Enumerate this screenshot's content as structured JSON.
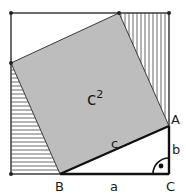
{
  "diagram": {
    "type": "pythagorean-proof-square",
    "colors": {
      "background": "#ffffff",
      "square_fill": "#bdbdbd",
      "outline": "#3a3a3a",
      "hatch": "#6a6a6a",
      "side_lines": "#111111"
    },
    "outer_square": {
      "x": 11,
      "y": 13,
      "size": 158
    },
    "inner_square": {
      "points": [
        [
          119,
          13
        ],
        [
          169,
          126
        ],
        [
          60,
          174
        ],
        [
          11,
          63
        ]
      ],
      "label": "c",
      "exponent": "2"
    },
    "vertices": {
      "A": {
        "label": "A",
        "x": 169,
        "y": 126
      },
      "B": {
        "label": "B",
        "x": 60,
        "y": 174
      },
      "C": {
        "label": "C",
        "x": 169,
        "y": 174
      }
    },
    "sides": {
      "a": {
        "label": "a"
      },
      "b": {
        "label": "b"
      },
      "c": {
        "label": "c"
      }
    },
    "corner_dots": [
      [
        11,
        13
      ],
      [
        119,
        13
      ],
      [
        169,
        13
      ],
      [
        11,
        63
      ],
      [
        11,
        174
      ]
    ],
    "right_angle_marker": {
      "x": 169,
      "y": 174,
      "radius": 16
    }
  }
}
